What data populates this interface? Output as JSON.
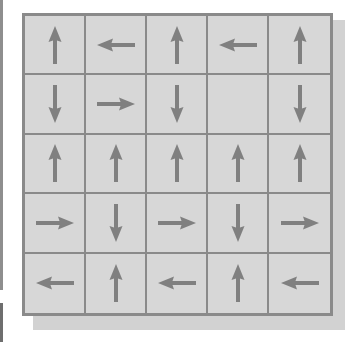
{
  "diagram": {
    "type": "arrow-grid",
    "rows": 5,
    "cols": 5,
    "colors": {
      "cell_fill": "#d7d7d7",
      "grid_line": "#8a8a8a",
      "arrow": "#808080",
      "shadow": "#d2d2d2"
    },
    "cells": [
      [
        "up",
        "left",
        "up",
        "left",
        "up"
      ],
      [
        "down",
        "right",
        "down",
        "none",
        "down"
      ],
      [
        "up",
        "up",
        "up",
        "up",
        "up"
      ],
      [
        "right",
        "down",
        "right",
        "down",
        "right"
      ],
      [
        "left",
        "up",
        "left",
        "up",
        "left"
      ]
    ]
  }
}
